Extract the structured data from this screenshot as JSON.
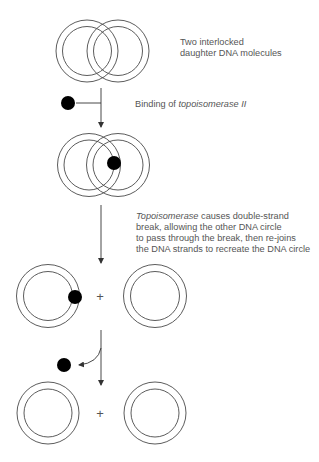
{
  "colors": {
    "stroke": "#4a4a4a",
    "enzyme": "#000000",
    "text": "#555555",
    "background": "#ffffff"
  },
  "steps": [
    {
      "id": "interlocked",
      "label_lines": [
        "Two interlocked",
        "daughter DNA molecules"
      ]
    },
    {
      "id": "binding",
      "label_prefix": "Binding of ",
      "label_italic": "topoisomerase II"
    },
    {
      "id": "strand-passage",
      "label_italic": "Topoisomerase",
      "label_first_rest": " causes double-strand",
      "label_lines": [
        "break, allowing the other DNA circle",
        "to pass through the break, then re-joins",
        "the DNA strands to recreate the DNA circle"
      ]
    },
    {
      "id": "separated-with-enzyme",
      "plus": "+"
    },
    {
      "id": "separated-released",
      "plus": "+"
    }
  ]
}
